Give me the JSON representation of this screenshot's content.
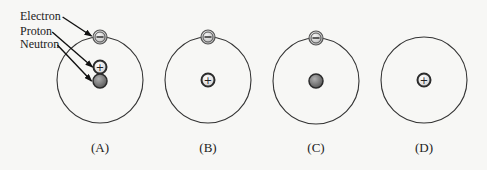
{
  "diagram": {
    "type": "atomic-models",
    "callouts": [
      {
        "text": "Electron",
        "x": 20,
        "y": 20,
        "target": "electron"
      },
      {
        "text": "Proton",
        "x": 20,
        "y": 35,
        "target": "proton"
      },
      {
        "text": "Neutron",
        "x": 20,
        "y": 48,
        "target": "neutron"
      }
    ],
    "atoms": [
      {
        "caption": "(A)",
        "cx": 100,
        "cy": 80,
        "r": 43,
        "electron": true,
        "proton": true,
        "neutron": true
      },
      {
        "caption": "(B)",
        "cx": 208,
        "cy": 80,
        "r": 43,
        "electron": true,
        "proton": true,
        "neutron": false
      },
      {
        "caption": "(C)",
        "cx": 316,
        "cy": 81,
        "r": 43,
        "electron": true,
        "proton": false,
        "neutron": true
      },
      {
        "caption": "(D)",
        "cx": 424,
        "cy": 80,
        "r": 43,
        "electron": false,
        "proton": true,
        "neutron": false
      }
    ],
    "symbols": {
      "electron": "−",
      "proton": "+"
    },
    "colors": {
      "orbit": "#333333",
      "electron_fill": "#c9c9c9",
      "proton_fill": "#e8e8e8",
      "neutron_fill": "#8a8a8a",
      "particle_rim": "#2b2b2b",
      "arrow": "#111111"
    }
  }
}
